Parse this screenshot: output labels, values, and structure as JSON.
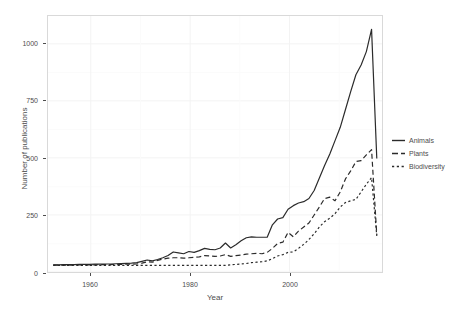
{
  "chart_data": {
    "type": "line",
    "title": "",
    "xlabel": "Year",
    "ylabel": "Number of publications",
    "xlim": [
      1954,
      2018
    ],
    "ylim": [
      -30,
      1120
    ],
    "xticks": [
      1960,
      1980,
      2000
    ],
    "xtick_labels": [
      "1960",
      "1980",
      "2000"
    ],
    "yticks": [
      0,
      250,
      500,
      750,
      1000
    ],
    "ytick_labels": [
      "0",
      "250",
      "500",
      "750",
      "1000"
    ],
    "grid": true,
    "legend_position": "right",
    "legend_entries": [
      "Animals",
      "Plants",
      "Biodiversity"
    ],
    "x": [
      1955,
      1956,
      1957,
      1958,
      1959,
      1960,
      1961,
      1962,
      1963,
      1964,
      1965,
      1966,
      1967,
      1968,
      1969,
      1970,
      1971,
      1972,
      1973,
      1974,
      1975,
      1976,
      1977,
      1978,
      1979,
      1980,
      1981,
      1982,
      1983,
      1984,
      1985,
      1986,
      1987,
      1988,
      1989,
      1990,
      1991,
      1992,
      1993,
      1994,
      1995,
      1996,
      1997,
      1998,
      1999,
      2000,
      2001,
      2002,
      2003,
      2004,
      2005,
      2006,
      2007,
      2008,
      2009,
      2010,
      2011,
      2012,
      2013,
      2014,
      2015,
      2016,
      2017
    ],
    "series": [
      {
        "name": "Animals",
        "linestyle": "solid",
        "color": "#2b2b2b",
        "values": [
          2,
          2,
          3,
          3,
          3,
          4,
          4,
          4,
          5,
          5,
          6,
          6,
          7,
          8,
          9,
          10,
          12,
          18,
          24,
          20,
          26,
          34,
          44,
          60,
          56,
          52,
          62,
          58,
          66,
          76,
          72,
          70,
          78,
          100,
          78,
          92,
          110,
          124,
          128,
          126,
          126,
          126,
          182,
          208,
          214,
          252,
          268,
          280,
          286,
          300,
          336,
          392,
          448,
          500,
          560,
          620,
          700,
          780,
          856,
          900,
          960,
          1060,
          480
        ]
      },
      {
        "name": "Plants",
        "linestyle": "dashed",
        "color": "#2b2b2b",
        "values": [
          1,
          1,
          1,
          1,
          2,
          2,
          2,
          2,
          2,
          3,
          3,
          3,
          4,
          4,
          5,
          5,
          6,
          10,
          16,
          14,
          22,
          28,
          32,
          34,
          34,
          32,
          34,
          36,
          38,
          44,
          42,
          40,
          42,
          48,
          40,
          44,
          46,
          50,
          52,
          54,
          52,
          58,
          76,
          98,
          104,
          148,
          128,
          154,
          172,
          190,
          226,
          262,
          300,
          306,
          290,
          330,
          388,
          424,
          466,
          470,
          496,
          520,
          136
        ]
      },
      {
        "name": "Biodiversity",
        "linestyle": "dotted",
        "color": "#2b2b2b",
        "values": [
          0,
          0,
          0,
          0,
          0,
          0,
          0,
          0,
          0,
          0,
          0,
          0,
          0,
          0,
          0,
          0,
          0,
          0,
          0,
          0,
          0,
          0,
          0,
          0,
          0,
          0,
          0,
          0,
          0,
          0,
          0,
          0,
          0,
          0,
          2,
          4,
          6,
          8,
          12,
          14,
          16,
          20,
          30,
          42,
          48,
          58,
          60,
          76,
          94,
          116,
          142,
          172,
          196,
          212,
          232,
          262,
          282,
          290,
          296,
          330,
          364,
          394,
          132
        ]
      }
    ]
  },
  "axis": {
    "y_title": "Number of publications",
    "x_title": "Year"
  },
  "legend": {
    "items": [
      {
        "label": "Animals",
        "key": "solid-line-key"
      },
      {
        "label": "Plants",
        "key": "dashed-line-key"
      },
      {
        "label": "Biodiversity",
        "key": "dotted-line-key"
      }
    ]
  },
  "colors": {
    "line": "#2b2b2b",
    "panel_border": "#d9d9d9",
    "grid_major": "#f2f2f2",
    "grid_minor": "#fafafa",
    "text": "#4d4d4d",
    "background": "#ffffff"
  }
}
